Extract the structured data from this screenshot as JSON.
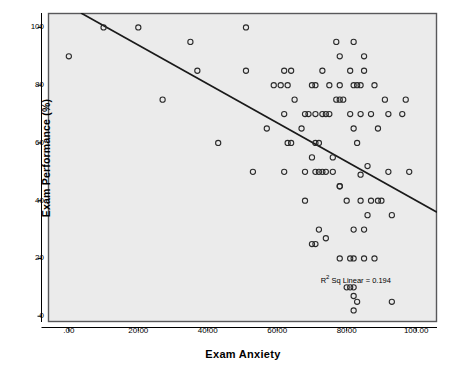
{
  "chart_data": {
    "type": "scatter",
    "title": "",
    "xlabel": "Exam Anxiety",
    "ylabel": "Exam Performance (%)",
    "xlim": [
      -6,
      106
    ],
    "ylim": [
      -2,
      105
    ],
    "grid": false,
    "legend": null,
    "annotation": "R Sq Linear = 0.194",
    "annotation_r_symbol": "R",
    "annotation_sup": "2",
    "annotation_rest": "Sq Linear = 0.194",
    "xticks": [
      0,
      20,
      40,
      60,
      80,
      100
    ],
    "xticklabels": [
      ".00",
      "20.00",
      "40.00",
      "60.00",
      "80.00",
      "100.00"
    ],
    "yticks": [
      0,
      20,
      40,
      60,
      80,
      100
    ],
    "yticklabels": [
      "0",
      "20",
      "40",
      "60",
      "80",
      "100"
    ],
    "marker": "open-circle",
    "marker_color": "#2b2b2b",
    "plot_bgcolor": "#ebebeb",
    "frame_color": "#58585a",
    "fit_line": {
      "type": "linear",
      "r_squared": 0.194,
      "x0": 3.5,
      "y0": 105,
      "x1": 106,
      "y1": 36
    },
    "points": [
      [
        0,
        90
      ],
      [
        10,
        100
      ],
      [
        20,
        100
      ],
      [
        27,
        75
      ],
      [
        35,
        95
      ],
      [
        37,
        85
      ],
      [
        43,
        60
      ],
      [
        51,
        100
      ],
      [
        51,
        85
      ],
      [
        53,
        50
      ],
      [
        57,
        65
      ],
      [
        59,
        80
      ],
      [
        61,
        80
      ],
      [
        62,
        85
      ],
      [
        62,
        70
      ],
      [
        62,
        50
      ],
      [
        63,
        80
      ],
      [
        63,
        60
      ],
      [
        64,
        85
      ],
      [
        64,
        60
      ],
      [
        65,
        75
      ],
      [
        67,
        65
      ],
      [
        68,
        70
      ],
      [
        68,
        40
      ],
      [
        68,
        50
      ],
      [
        69,
        70
      ],
      [
        70,
        80
      ],
      [
        70,
        25
      ],
      [
        70,
        55
      ],
      [
        71,
        80
      ],
      [
        71,
        60
      ],
      [
        71,
        25
      ],
      [
        71,
        50
      ],
      [
        71,
        70
      ],
      [
        72,
        50
      ],
      [
        72,
        30
      ],
      [
        72,
        60
      ],
      [
        73,
        70
      ],
      [
        73,
        50
      ],
      [
        73,
        85
      ],
      [
        74,
        50
      ],
      [
        74,
        70
      ],
      [
        74,
        27
      ],
      [
        75,
        70
      ],
      [
        75,
        80
      ],
      [
        76,
        55
      ],
      [
        76,
        50
      ],
      [
        77,
        95
      ],
      [
        77,
        75
      ],
      [
        78,
        80
      ],
      [
        78,
        45
      ],
      [
        78,
        45
      ],
      [
        78,
        90
      ],
      [
        78,
        75
      ],
      [
        78,
        20
      ],
      [
        79,
        75
      ],
      [
        80,
        40
      ],
      [
        80,
        10
      ],
      [
        81,
        85
      ],
      [
        81,
        70
      ],
      [
        81,
        20
      ],
      [
        81,
        10
      ],
      [
        82,
        80
      ],
      [
        82,
        95
      ],
      [
        82,
        65
      ],
      [
        82,
        30
      ],
      [
        82,
        7
      ],
      [
        82,
        2
      ],
      [
        82,
        20
      ],
      [
        82,
        10
      ],
      [
        83,
        60
      ],
      [
        83,
        80
      ],
      [
        83,
        5
      ],
      [
        84,
        80
      ],
      [
        84,
        70
      ],
      [
        84,
        49
      ],
      [
        84,
        40
      ],
      [
        85,
        90
      ],
      [
        85,
        30
      ],
      [
        85,
        85
      ],
      [
        85,
        20
      ],
      [
        86,
        52
      ],
      [
        86,
        35
      ],
      [
        87,
        70
      ],
      [
        87,
        40
      ],
      [
        88,
        80
      ],
      [
        88,
        20
      ],
      [
        89,
        65
      ],
      [
        89,
        40
      ],
      [
        90,
        40
      ],
      [
        91,
        75
      ],
      [
        92,
        50
      ],
      [
        92,
        70
      ],
      [
        93,
        5
      ],
      [
        93,
        35
      ],
      [
        96,
        70
      ],
      [
        97,
        75
      ],
      [
        98,
        50
      ]
    ]
  }
}
